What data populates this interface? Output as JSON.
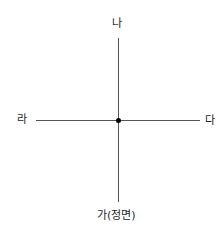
{
  "diagram": {
    "type": "direction-cross",
    "labels": {
      "top": "나",
      "right": "다",
      "left": "라",
      "bottom": "가(정면)"
    },
    "colors": {
      "line": "#555555",
      "dot": "#000000",
      "text": "#1e1e1e"
    }
  }
}
